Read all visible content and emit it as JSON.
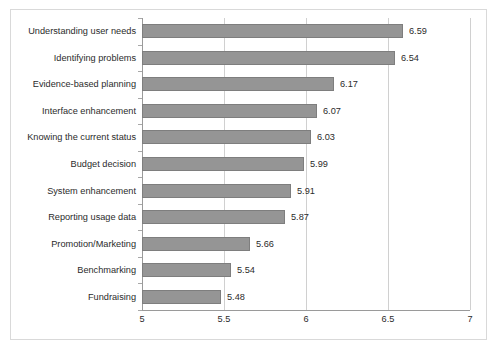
{
  "chart_data": {
    "type": "bar",
    "orientation": "horizontal",
    "title": "",
    "xlabel": "",
    "ylabel": "",
    "xlim": [
      5,
      7
    ],
    "xticks": [
      "5",
      "5.5",
      "6",
      "6.5",
      "7"
    ],
    "xtick_values": [
      5,
      5.5,
      6,
      6.5,
      7
    ],
    "grid": true,
    "legend": false,
    "bar_color": "#959595",
    "bar_edge_color": "#7e7e7e",
    "gridline_color": "#d0d0d0",
    "axis_color": "#9a9a9a",
    "text_color": "#2b2b2b",
    "categories": [
      "Understanding user needs",
      "Identifying problems",
      "Evidence-based planning",
      "Interface enhancement",
      "Knowing the current status",
      "Budget decision",
      "System enhancement",
      "Reporting usage data",
      "Promotion/Marketing",
      "Benchmarking",
      "Fundraising"
    ],
    "values": [
      6.59,
      6.54,
      6.17,
      6.07,
      6.03,
      5.99,
      5.91,
      5.87,
      5.66,
      5.54,
      5.48
    ],
    "value_labels": [
      "6.59",
      "6.54",
      "6.17",
      "6.07",
      "6.03",
      "5.99",
      "5.91",
      "5.87",
      "5.66",
      "5.54",
      "5.48"
    ]
  }
}
